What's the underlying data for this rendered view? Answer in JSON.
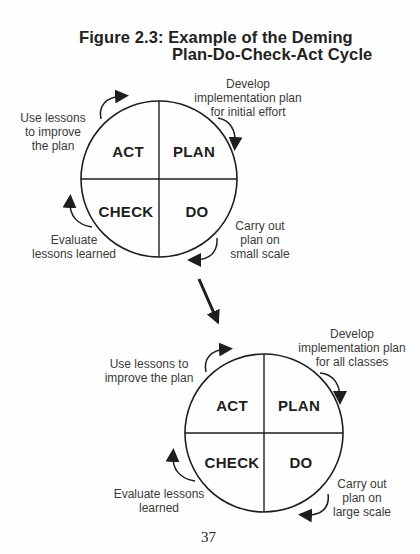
{
  "figure": {
    "title_line1": "Figure 2.3: Example of the Deming",
    "title_line2": "Plan-Do-Check-Act Cycle"
  },
  "cycles": [
    {
      "quadrants": {
        "act": "ACT",
        "plan": "PLAN",
        "check": "CHECK",
        "do": "DO"
      },
      "notes": {
        "act": [
          "Use lessons",
          "to improve",
          "the plan"
        ],
        "plan": [
          "Develop",
          "implementation plan",
          "for initial effort"
        ],
        "do": [
          "Carry out",
          "plan on",
          "small scale"
        ],
        "check": [
          "Evaluate",
          "lessons learned"
        ]
      }
    },
    {
      "quadrants": {
        "act": "ACT",
        "plan": "PLAN",
        "check": "CHECK",
        "do": "DO"
      },
      "notes": {
        "act": [
          "Use lessons to",
          "improve the plan"
        ],
        "plan": [
          "Develop",
          "implementation plan",
          "for all classes"
        ],
        "do": [
          "Carry out",
          "plan on",
          "large scale"
        ],
        "check": [
          "Evaluate lessons",
          "learned"
        ]
      }
    }
  ],
  "transition_arrow": "cycle-1-to-cycle-2",
  "page_number": "37",
  "colors": {
    "ink": "#1e1e1e",
    "note_text": "#3a3a3a",
    "background": "#fefefe"
  }
}
